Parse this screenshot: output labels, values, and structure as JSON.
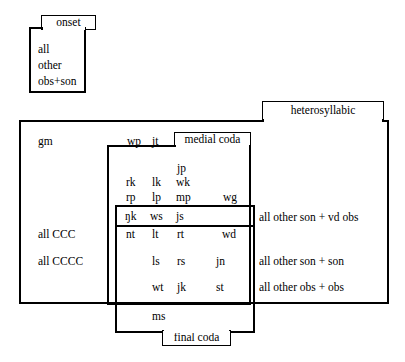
{
  "diagram": {
    "type": "nested-venn-boxes",
    "groups": [
      {
        "id": "onset",
        "label": "onset",
        "tab_position": "top"
      },
      {
        "id": "heterosyllabic",
        "label": "heterosyllabic",
        "tab_position": "top-right"
      },
      {
        "id": "medial_coda",
        "label": "medial coda",
        "tab_position": "top"
      },
      {
        "id": "final_coda",
        "label": "final coda",
        "tab_position": "bottom"
      }
    ]
  },
  "onset": {
    "label": "onset",
    "items": [
      "all",
      "other",
      "obs+son"
    ]
  },
  "heterosyllabic": {
    "label": "heterosyllabic",
    "left_labels": [
      "gm",
      "all CCC",
      "all CCCC"
    ],
    "right_labels": [
      "all other son + vd obs",
      "all other son + son",
      "all other obs + obs"
    ]
  },
  "medial_coda": {
    "label": "medial coda"
  },
  "final_coda": {
    "label": "final coda"
  },
  "clusters": {
    "row_gm": [
      "wp",
      "jt"
    ],
    "row_jp": [
      "jp"
    ],
    "row_rk": [
      "rk",
      "lk",
      "wk"
    ],
    "row_rp": [
      "rp",
      "lp",
      "mp",
      "wg"
    ],
    "row_nk": [
      "ŋk",
      "ws",
      "js"
    ],
    "row_nt": [
      "nt",
      "lt",
      "rt",
      "wd"
    ],
    "row_ls": [
      "ls",
      "rs",
      "jn"
    ],
    "row_wt": [
      "wt",
      "jk",
      "st"
    ],
    "row_ms": [
      "ms"
    ]
  },
  "colors": {
    "stroke": "#000000",
    "background": "#ffffff",
    "text": "#000000"
  }
}
